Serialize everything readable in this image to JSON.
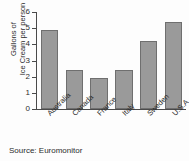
{
  "chart_data": {
    "type": "bar",
    "title": "",
    "subtitle": "",
    "xlabel": "",
    "ylabel": "Gallons of Ice Cream per person",
    "ylabel_line1": "Gallons of",
    "ylabel_line2": "Ice Cream per person",
    "categories": [
      "Australia",
      "Canada",
      "France",
      "Italy",
      "Sweden",
      "U.S.A"
    ],
    "values": [
      4.9,
      2.4,
      1.9,
      2.4,
      4.2,
      5.4
    ],
    "ylim": [
      0,
      6
    ],
    "ytick_labels": [
      "0",
      "1",
      "2",
      "3",
      "4",
      "5",
      "6"
    ],
    "ytick_values": [
      0,
      1,
      2,
      3,
      4,
      5,
      6
    ],
    "grid": false,
    "legend": false,
    "legend_position": "none",
    "bar_color": "#9a9a9a",
    "bar_edge_color": "#6f6f6f",
    "axis_color": "#4a4a4a",
    "background_color": "#fdfdfd",
    "text_color": "#2b2b2b"
  },
  "caption": {
    "source_text": "Source: Euromonitor"
  }
}
